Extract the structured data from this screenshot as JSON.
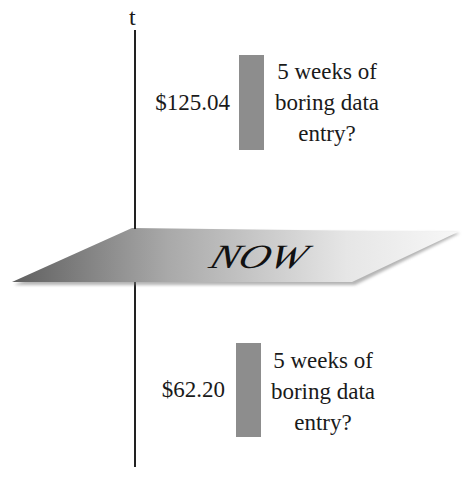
{
  "axis": {
    "label": "t"
  },
  "plane": {
    "label": "NOW",
    "gradient_dark": "#6e6e6e",
    "gradient_light": "#f2f2f2"
  },
  "future": {
    "price": "$125.04",
    "note": [
      "5 weeks of",
      "boring data",
      "entry?"
    ]
  },
  "past": {
    "price": "$62.20",
    "note": [
      "5 weeks of",
      "boring data",
      "entry?"
    ]
  },
  "colors": {
    "bar": "#8d8d8d",
    "axis": "#222222"
  }
}
